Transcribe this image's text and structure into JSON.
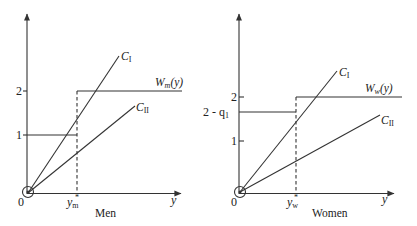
{
  "panels": [
    {
      "id": "men",
      "caption": "Men",
      "origin_label": "0",
      "x_axis_label": "y",
      "threshold_label": "y",
      "threshold_sub": "m",
      "threshold_sup": "*",
      "y_ticks": [
        {
          "label": "1",
          "value": 1
        },
        {
          "label": "2",
          "value": 2
        }
      ],
      "wage_label": "W",
      "wage_sub": "m",
      "wage_arg": "(y)",
      "lower_wage_level": "1",
      "lower_wage_label": "",
      "upper_wage_level": "2",
      "line_labels": {
        "c1": "C",
        "c1_sub": "I",
        "c2": "C",
        "c2_sub": "II"
      }
    },
    {
      "id": "women",
      "caption": "Women",
      "origin_label": "0",
      "x_axis_label": "y",
      "threshold_label": "y",
      "threshold_sub": "w",
      "threshold_sup": "*",
      "y_ticks": [
        {
          "label": "1",
          "value": 1
        },
        {
          "label": "2",
          "value": 2
        }
      ],
      "wage_label": "W",
      "wage_sub": "w",
      "wage_arg": "(y)",
      "lower_wage_level": "2 - q1",
      "lower_wage_label": "2 - q",
      "lower_wage_sub": "1",
      "upper_wage_level": "2",
      "line_labels": {
        "c1": "C",
        "c1_sub": "I",
        "c2": "C",
        "c2_sub": "II"
      }
    }
  ],
  "colors": {
    "ink": "#333333",
    "background": "#ffffff"
  }
}
